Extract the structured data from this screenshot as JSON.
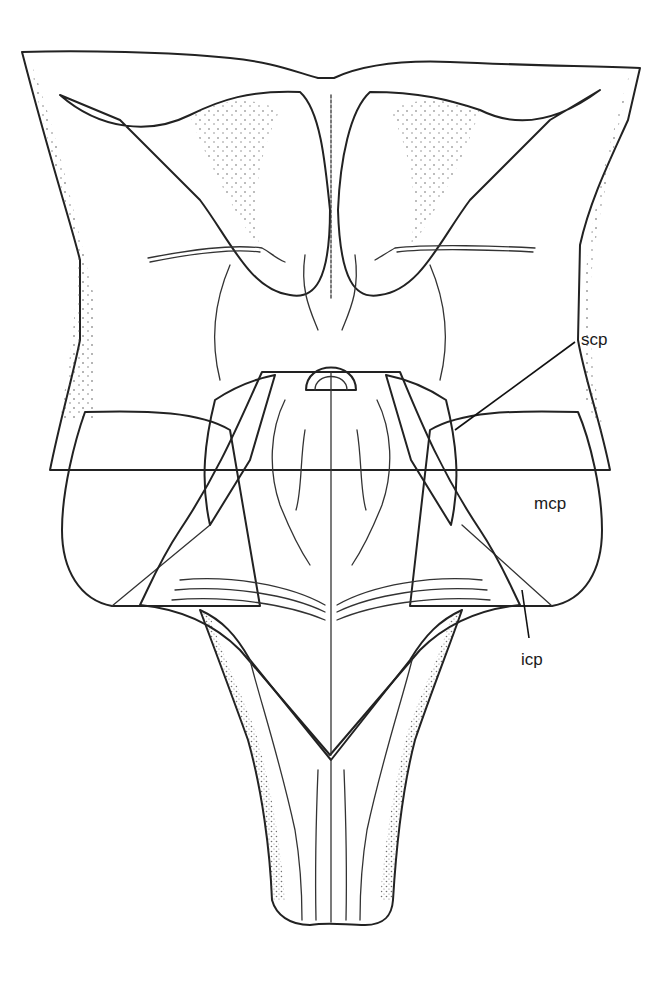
{
  "figure": {
    "colors": {
      "background": "#ffffff",
      "line": "#222222",
      "fourth_ventricle_floor": "#9a9a9a",
      "stipple": "#444444"
    }
  },
  "labels": [
    {
      "id": "scp",
      "text": "scp"
    },
    {
      "id": "mcp",
      "text": "mcp"
    },
    {
      "id": "icp",
      "text": "icp"
    }
  ]
}
